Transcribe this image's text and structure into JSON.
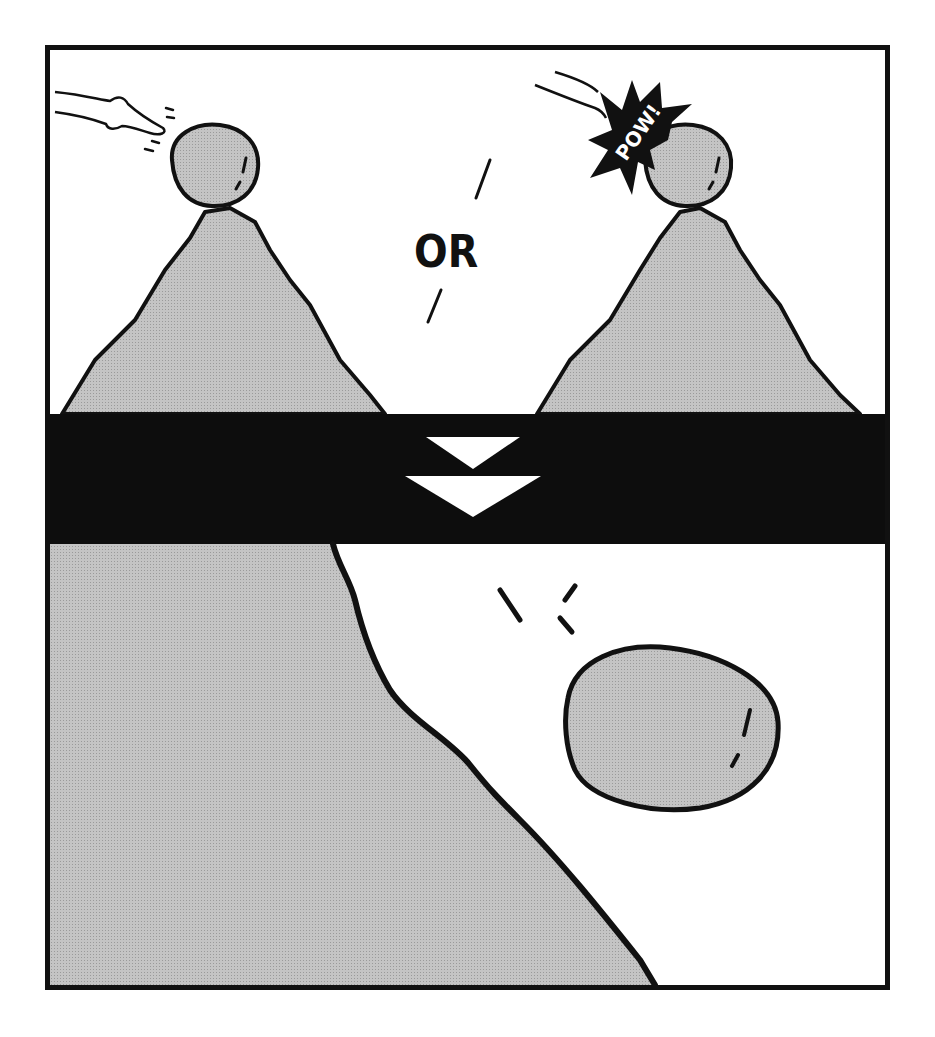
{
  "comic": {
    "top_panel": {
      "left_scene": "finger flicking boulder atop mountain peak",
      "right_scene": "fist punching boulder atop mountain peak",
      "divider_text": "OR",
      "sound_effect": "POW!"
    },
    "transition_band": {
      "icon": "double-down-arrow-icon"
    },
    "bottom_panel": {
      "scene": "boulder falling down cliff slope"
    },
    "colors": {
      "ink": "#111111",
      "rock_fill": "#bdbdbd",
      "background": "#ffffff",
      "band": "#0d0d0d"
    }
  }
}
